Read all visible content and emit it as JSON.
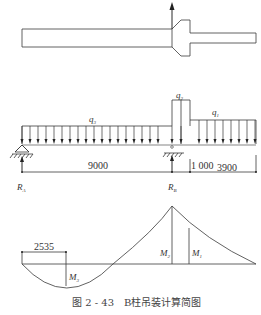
{
  "figure": {
    "caption_number": "图 2 - 43",
    "caption_title": "B柱吊装计算简图"
  },
  "column_sketch": {
    "lift_arrow": "up-arrow"
  },
  "load_diagram": {
    "loads": [
      {
        "symbol": "q",
        "sub": "3"
      },
      {
        "symbol": "q",
        "sub": "2"
      },
      {
        "symbol": "q",
        "sub": "1"
      }
    ],
    "spans": [
      "9000",
      "1 000",
      "3900"
    ],
    "reactions": [
      {
        "symbol": "R",
        "sub": "A"
      },
      {
        "symbol": "R",
        "sub": "B"
      }
    ]
  },
  "moment_diagram": {
    "dimension": "2535",
    "moments": [
      {
        "symbol": "M",
        "sub": "3"
      },
      {
        "symbol": "M",
        "sub": "2"
      },
      {
        "symbol": "M",
        "sub": "1"
      }
    ]
  }
}
